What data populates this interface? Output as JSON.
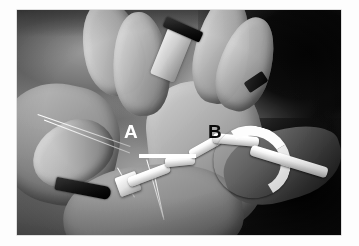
{
  "figure": {
    "type": "photograph",
    "modality": "intraoperative surgical photograph",
    "color_mode": "grayscale",
    "background_color": "#fdfdfd",
    "photo": {
      "left": 17,
      "top": 10,
      "width": 324,
      "height": 225
    }
  },
  "annotations": {
    "label_a": {
      "text": "A",
      "color": "#ffffff",
      "x": 107,
      "y": 112
    },
    "label_b": {
      "text": "B",
      "color": "#111111",
      "x": 191,
      "y": 112
    },
    "pointer_bar": {
      "color": "#ffffff",
      "x": 122,
      "y": 144,
      "width": 57,
      "height": 4
    }
  },
  "scene": {
    "elements": [
      "gloved-fingers",
      "tissue-flaps",
      "curved-cannula-tube",
      "metal-instrument-blades",
      "suture-strands",
      "retractor"
    ]
  }
}
